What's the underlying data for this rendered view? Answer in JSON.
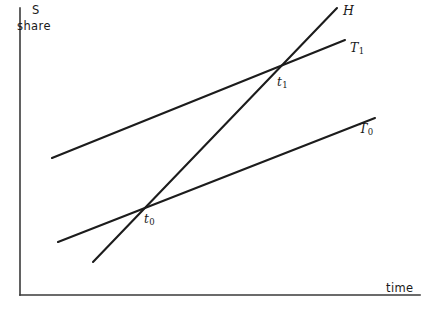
{
  "axes": {
    "y_title_line1": "S",
    "y_title_line2": "share",
    "x_title": "time"
  },
  "labels": {
    "H": "H",
    "T1_base": "T",
    "T1_sub": "1",
    "T0_base": "T",
    "T0_sub": "0",
    "t1_base": "t",
    "t1_sub": "1",
    "t0_base": "t",
    "t0_sub": "0"
  },
  "colors": {
    "line": "#1c1c1c",
    "axis": "#3a3a3a",
    "background": "#ffffff",
    "text": "#1a1a1a"
  },
  "chart_data": {
    "type": "line",
    "title": "",
    "xlabel": "time",
    "ylabel": "S share",
    "grid": false,
    "legend": "inline-end-labels",
    "axis_style": "open-right-open-top",
    "xlim": [
      20,
      423
    ],
    "ylim": [
      8,
      295
    ],
    "note": "Coordinates are in screen pixels; y increases downward. Higher on screen = larger S share.",
    "series": [
      {
        "name": "H",
        "label": "H",
        "description": "steepest rising line, crosses both T0 and T1",
        "points": [
          [
            93,
            262
          ],
          [
            337,
            8
          ]
        ],
        "label_position": [
          343,
          11
        ]
      },
      {
        "name": "T1",
        "label": "T₁",
        "description": "upper shallow line, starts highest on the left",
        "points": [
          [
            52,
            158
          ],
          [
            345,
            40
          ]
        ],
        "label_position": [
          350,
          48
        ]
      },
      {
        "name": "T0",
        "label": "T₀",
        "description": "lower shallow line, parallel-ish to T1",
        "points": [
          [
            58,
            242
          ],
          [
            375,
            118
          ]
        ],
        "label_position": [
          359,
          129
        ]
      }
    ],
    "annotations": [
      {
        "name": "t0",
        "label": "t₀",
        "description": "intersection of H and T0",
        "x": 143,
        "y": 208,
        "label_position": [
          144,
          219
        ]
      },
      {
        "name": "t1",
        "label": "t₁",
        "description": "intersection of H and T1",
        "x": 283,
        "y": 67,
        "label_position": [
          277,
          82
        ]
      }
    ]
  }
}
